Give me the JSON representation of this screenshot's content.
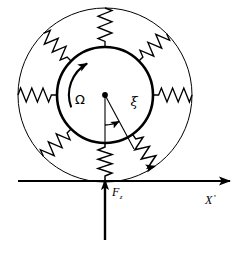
{
  "figure": {
    "background_color": "#ffffff",
    "stroke_color": "#000000",
    "center": {
      "x": 105,
      "y": 95
    },
    "inner_circle": {
      "radius": 48,
      "stroke_width": 2.6,
      "name": "rotor-circle"
    },
    "outer_circle": {
      "radius": 87,
      "stroke_width": 1.0,
      "name": "stator-circle"
    },
    "springs": {
      "count": 8,
      "angles_deg": [
        0,
        45,
        90,
        135,
        180,
        225,
        270,
        315
      ],
      "coils": 7,
      "amplitude": 7
    }
  },
  "labels": {
    "omega": "Ω",
    "xi": "ξ",
    "force": "F",
    "force_subscript": "z",
    "axis": "X",
    "axis_prime": "’"
  },
  "annotations": {
    "rotation_arrow": {
      "name": "rotation-arrow",
      "direction": "counterclockwise",
      "symbol": "Ω",
      "radius": 36,
      "start_deg": 200,
      "end_deg": 118
    },
    "displacement_vector": {
      "name": "displacement-vector",
      "symbol": "ξ",
      "angle_from_vertical_deg": 28,
      "length": 62
    },
    "angle_arc": {
      "name": "angle-arc",
      "radius": 30,
      "from_deg": 270,
      "to_deg": 298
    },
    "force_vector": {
      "name": "force-vector",
      "symbol": "F",
      "subscript": "z",
      "direction": "up",
      "x": 105,
      "tail_y": 240,
      "head_y": 178
    },
    "axis_x": {
      "name": "x-axis",
      "symbol": "X’",
      "y": 181,
      "from_x": 18,
      "to_x": 234
    },
    "spring_arrow": {
      "name": "spring-contact-arrow",
      "angle_deg": 305
    }
  }
}
